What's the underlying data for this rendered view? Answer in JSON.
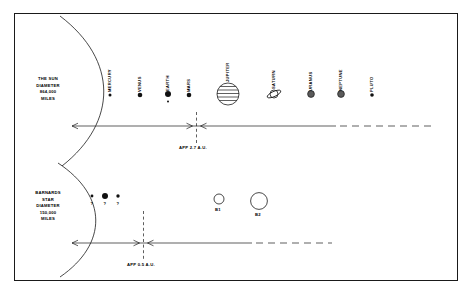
{
  "figure": {
    "type": "diagram",
    "frame": {
      "border_color": "#1a1a1a",
      "background": "#ffffff"
    }
  },
  "top_system": {
    "star": {
      "name": "THE SUN",
      "line1": "THE SUN",
      "line2": "DIAMETER",
      "line3": "864,000",
      "line4": "MILES"
    },
    "planets": [
      {
        "label": "MERCURY",
        "x": 110,
        "y": 95,
        "r": 1.5,
        "style": "filled"
      },
      {
        "label": "VENUS",
        "x": 140,
        "y": 95,
        "r": 2.3,
        "style": "filled"
      },
      {
        "label": "EARTH",
        "x": 168,
        "y": 94,
        "r": 3.0,
        "style": "filled"
      },
      {
        "label": "MARS",
        "x": 189,
        "y": 95,
        "r": 2.3,
        "style": "filled"
      },
      {
        "label": "JUPITER",
        "x": 228,
        "y": 94,
        "r": 11.0,
        "style": "striped"
      },
      {
        "label": "SATURN",
        "x": 274,
        "y": 94,
        "r": 5.0,
        "style": "ringed"
      },
      {
        "label": "URANUS",
        "x": 311,
        "y": 94,
        "r": 3.4,
        "style": "shaded"
      },
      {
        "label": "NEPTUNE",
        "x": 341,
        "y": 94,
        "r": 3.4,
        "style": "shaded"
      },
      {
        "label": "PLUTO",
        "x": 372,
        "y": 95,
        "r": 1.8,
        "style": "filled"
      }
    ],
    "moon": {
      "x": 168,
      "y": 101,
      "r": 1.0
    },
    "scale_note": "APP 2.7 A.U.",
    "axis": {
      "y": 126,
      "left_x": 70,
      "right_x": 432,
      "marker_x": 196
    }
  },
  "bottom_system": {
    "star": {
      "name": "BARNARDS STAR",
      "line1": "BARNARDS",
      "line2": "STAR",
      "line3": "DIAMETER",
      "line4": "150,000",
      "line5": "MILES"
    },
    "unknown_planets": [
      {
        "label": "?",
        "x": 92,
        "y": 196,
        "r": 1.4
      },
      {
        "label": "?",
        "x": 105,
        "y": 196,
        "r": 3.0
      },
      {
        "label": "?",
        "x": 118,
        "y": 196,
        "r": 1.7
      }
    ],
    "companions": [
      {
        "label": "B1",
        "x": 219,
        "y": 199,
        "r": 5.0
      },
      {
        "label": "B2",
        "x": 259,
        "y": 201,
        "r": 8.4
      }
    ],
    "scale_note": "APP 0.5 A.U.",
    "axis": {
      "y": 243,
      "left_x": 70,
      "right_x": 432,
      "marker_x": 143
    }
  }
}
